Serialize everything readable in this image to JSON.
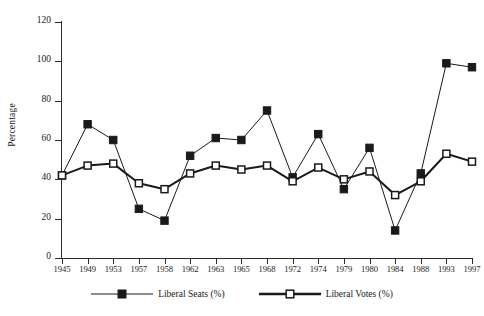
{
  "chart_data": {
    "type": "line",
    "title": "",
    "xlabel": "",
    "ylabel": "Percentage",
    "ylim": [
      0,
      120
    ],
    "ytick_step": 20,
    "yticks": [
      0,
      20,
      40,
      60,
      80,
      100,
      120
    ],
    "grid": false,
    "legend_position": "bottom",
    "categories": [
      "1945",
      "1949",
      "1953",
      "1957",
      "1958",
      "1962",
      "1963",
      "1965",
      "1968",
      "1972",
      "1974",
      "1979",
      "1980",
      "1984",
      "1988",
      "1993",
      "1997"
    ],
    "series": [
      {
        "name": "Liberal Seats (%)",
        "marker": "filled-square",
        "color": "#1a1a1a",
        "values": [
          42,
          68,
          60,
          25,
          19,
          52,
          61,
          60,
          75,
          41,
          63,
          35,
          56,
          14,
          43,
          99,
          97
        ]
      },
      {
        "name": "Liberal Votes (%)",
        "marker": "open-square",
        "color": "#1a1a1a",
        "values": [
          42,
          47,
          48,
          38,
          35,
          43,
          47,
          45,
          47,
          39,
          46,
          40,
          44,
          32,
          39,
          53,
          49
        ]
      }
    ]
  },
  "axes": {
    "y_title": "Percentage"
  },
  "legend": {
    "items": [
      {
        "label": "Liberal Seats (%)",
        "marker": "filled-square"
      },
      {
        "label": "Liberal Votes (%)",
        "marker": "open-square"
      }
    ]
  },
  "colors": {
    "ink": "#1a1a1a",
    "axis": "#2b2b2b",
    "background": "#ffffff"
  }
}
